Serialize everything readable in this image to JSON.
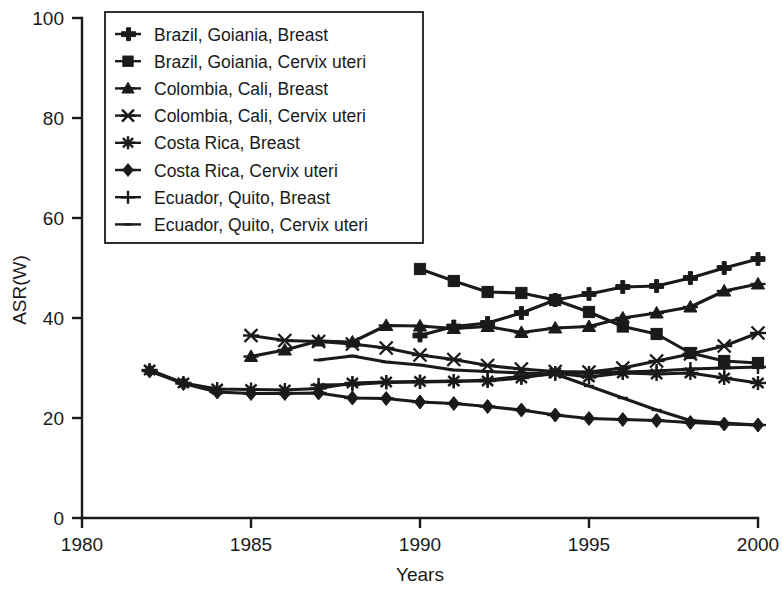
{
  "chart_data": {
    "type": "line",
    "title": "",
    "xlabel": "Years",
    "ylabel": "ASR(W)",
    "xlim": [
      1980,
      2000
    ],
    "ylim": [
      0,
      100
    ],
    "xticks": [
      1980,
      1985,
      1990,
      1995,
      2000
    ],
    "yticks": [
      0,
      20,
      40,
      60,
      80,
      100
    ],
    "grid": false,
    "legend_position": "top-left",
    "series": [
      {
        "name": "Brazil, Goiania, Breast",
        "marker": "plus-bold",
        "x": [
          1990,
          1991,
          1992,
          1993,
          1994,
          1995,
          1996,
          1997,
          1998,
          1999,
          2000
        ],
        "values": [
          36.5,
          38.3,
          39.0,
          41.0,
          43.6,
          44.8,
          46.2,
          46.4,
          48.0,
          50.0,
          51.8
        ]
      },
      {
        "name": "Brazil, Goiania, Cervix uteri",
        "marker": "square",
        "x": [
          1990,
          1991,
          1992,
          1993,
          1994,
          1995,
          1996,
          1997,
          1998,
          1999,
          2000
        ],
        "values": [
          49.8,
          47.4,
          45.2,
          45.0,
          43.6,
          41.2,
          38.3,
          36.8,
          33.0,
          31.4,
          31.0
        ]
      },
      {
        "name": "Colombia, Cali, Breast",
        "marker": "triangle",
        "x": [
          1985,
          1986,
          1987,
          1988,
          1989,
          1990,
          1991,
          1992,
          1993,
          1994,
          1995,
          1996,
          1997,
          1998,
          1999,
          2000
        ],
        "values": [
          32.3,
          33.6,
          35.4,
          35.2,
          38.5,
          38.4,
          37.9,
          38.3,
          37.1,
          38.0,
          38.3,
          40.0,
          41.0,
          42.2,
          45.4,
          46.8
        ]
      },
      {
        "name": "Colombia, Cali, Cervix uteri",
        "marker": "x-cross",
        "x": [
          1985,
          1986,
          1987,
          1988,
          1989,
          1990,
          1991,
          1992,
          1993,
          1994,
          1995,
          1996,
          1997,
          1998,
          1999,
          2000
        ],
        "values": [
          36.5,
          35.5,
          35.3,
          34.8,
          34.0,
          32.6,
          31.7,
          30.5,
          29.8,
          29.3,
          29.2,
          30.0,
          31.4,
          32.8,
          34.4,
          37.0
        ]
      },
      {
        "name": "Costa Rica, Breast",
        "marker": "asterisk",
        "x": [
          1982,
          1983,
          1984,
          1985,
          1986,
          1987,
          1988,
          1989,
          1990,
          1991,
          1992,
          1993,
          1994,
          1995,
          1996,
          1997,
          1998,
          1999,
          2000
        ],
        "values": [
          29.6,
          27.0,
          25.8,
          25.7,
          25.6,
          25.9,
          27.0,
          27.2,
          27.3,
          27.4,
          27.4,
          28.0,
          29.0,
          28.2,
          29.0,
          28.8,
          29.0,
          28.0,
          27.0
        ]
      },
      {
        "name": "Costa Rica, Cervix uteri",
        "marker": "diamond",
        "x": [
          1982,
          1983,
          1984,
          1985,
          1986,
          1987,
          1988,
          1989,
          1990,
          1991,
          1992,
          1993,
          1994,
          1995,
          1996,
          1997,
          1998,
          1999,
          2000
        ],
        "values": [
          29.4,
          26.9,
          25.2,
          24.9,
          24.9,
          25.0,
          24.0,
          23.9,
          23.2,
          22.9,
          22.3,
          21.6,
          20.6,
          19.9,
          19.7,
          19.5,
          19.1,
          18.8,
          18.6
        ]
      },
      {
        "name": "Ecuador, Quito, Breast",
        "marker": "plus-thin",
        "x": [
          1987,
          1988,
          1989,
          1990,
          1991,
          1992,
          1993,
          1994,
          1995,
          1996,
          1997,
          1998,
          1999,
          2000
        ],
        "values": [
          26.6,
          26.7,
          27.1,
          27.2,
          27.3,
          27.6,
          28.3,
          28.8,
          29.0,
          29.2,
          29.4,
          29.8,
          30.0,
          30.2
        ]
      },
      {
        "name": "Ecuador, Quito, Cervix uteri",
        "marker": "dash",
        "x": [
          1987,
          1988,
          1989,
          1990,
          1991,
          1992,
          1993,
          1994,
          1995,
          1996,
          1997,
          1998,
          1999,
          2000
        ],
        "values": [
          31.6,
          32.4,
          31.2,
          30.6,
          29.6,
          29.3,
          29.0,
          28.8,
          26.4,
          24.0,
          21.6,
          19.5,
          19.0,
          18.6
        ]
      }
    ]
  },
  "axes": {
    "ylabel": "ASR(W)",
    "xlabel": "Years",
    "xtick_labels": [
      "1980",
      "1985",
      "1990",
      "1995",
      "2000"
    ],
    "ytick_labels": [
      "0",
      "20",
      "40",
      "60",
      "80",
      "100"
    ]
  },
  "legend": {
    "entries": [
      "Brazil, Goiania, Breast",
      "Brazil, Goiania, Cervix uteri",
      "Colombia, Cali, Breast",
      "Colombia, Cali, Cervix uteri",
      "Costa Rica, Breast",
      "Costa Rica, Cervix uteri",
      "Ecuador, Quito, Breast",
      "Ecuador, Quito, Cervix uteri"
    ]
  },
  "colors": {
    "ink": "#1a1a1a",
    "background": "#ffffff"
  }
}
